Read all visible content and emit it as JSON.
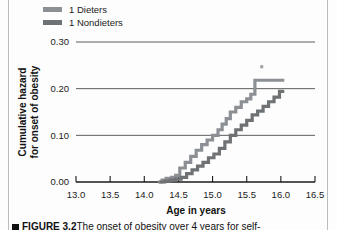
{
  "figure": {
    "background_color": "#fdfdfd",
    "page_rule_color": "#b9bcbe"
  },
  "legend": {
    "position": "top-left",
    "items": [
      {
        "label": "1 Dieters",
        "color": "#8c9094"
      },
      {
        "label": "1 Nondieters",
        "color": "#6e7275"
      }
    ]
  },
  "caption": {
    "figure_number": "FIGURE 3.2",
    "text": "The onset of obesity over 4 years for self-"
  },
  "chart_data": {
    "type": "line",
    "subtype": "step",
    "title": "",
    "xlabel": "Age in years",
    "ylabel": "Cumulative hazard for onset of obesity",
    "xlim": [
      13.0,
      16.5
    ],
    "ylim": [
      0.0,
      0.3
    ],
    "xticks": [
      13.0,
      13.5,
      14.0,
      14.5,
      15.0,
      15.5,
      16.0,
      16.5
    ],
    "xtick_labels": [
      "13.0",
      "13.5",
      "14.0",
      "14.5",
      "15.0",
      "15.5",
      "16.0",
      "16.5"
    ],
    "yticks": [
      0.0,
      0.1,
      0.2,
      0.3
    ],
    "ytick_labels": [
      "0.00",
      "0.10",
      "0.20",
      "0.30"
    ],
    "grid": "horizontal",
    "legend_position": "above-plot-left",
    "annotations": [
      {
        "type": "censor-tick",
        "x": 15.72,
        "y": 0.247
      }
    ],
    "series": [
      {
        "name": "1 Dieters",
        "color": "#8c9094",
        "step": "post",
        "x": [
          14.2,
          14.26,
          14.32,
          14.4,
          14.46,
          14.52,
          14.6,
          14.68,
          14.76,
          14.84,
          14.92,
          15.0,
          15.08,
          15.14,
          15.2,
          15.26,
          15.34,
          15.42,
          15.5,
          15.56,
          15.62,
          16.05
        ],
        "y": [
          0.0,
          0.004,
          0.008,
          0.01,
          0.014,
          0.03,
          0.042,
          0.055,
          0.068,
          0.08,
          0.09,
          0.1,
          0.112,
          0.124,
          0.136,
          0.15,
          0.16,
          0.172,
          0.178,
          0.188,
          0.218,
          0.218
        ]
      },
      {
        "name": "1 Nondieters",
        "color": "#6e7275",
        "step": "post",
        "x": [
          14.22,
          14.3,
          14.38,
          14.46,
          14.54,
          14.62,
          14.7,
          14.78,
          14.86,
          14.94,
          15.02,
          15.1,
          15.18,
          15.26,
          15.34,
          15.42,
          15.5,
          15.58,
          15.66,
          15.74,
          15.82,
          15.9,
          15.98,
          16.05
        ],
        "y": [
          0.0,
          0.002,
          0.004,
          0.006,
          0.01,
          0.018,
          0.026,
          0.034,
          0.042,
          0.052,
          0.06,
          0.072,
          0.086,
          0.1,
          0.112,
          0.122,
          0.132,
          0.144,
          0.152,
          0.162,
          0.172,
          0.182,
          0.194,
          0.194
        ]
      }
    ]
  }
}
